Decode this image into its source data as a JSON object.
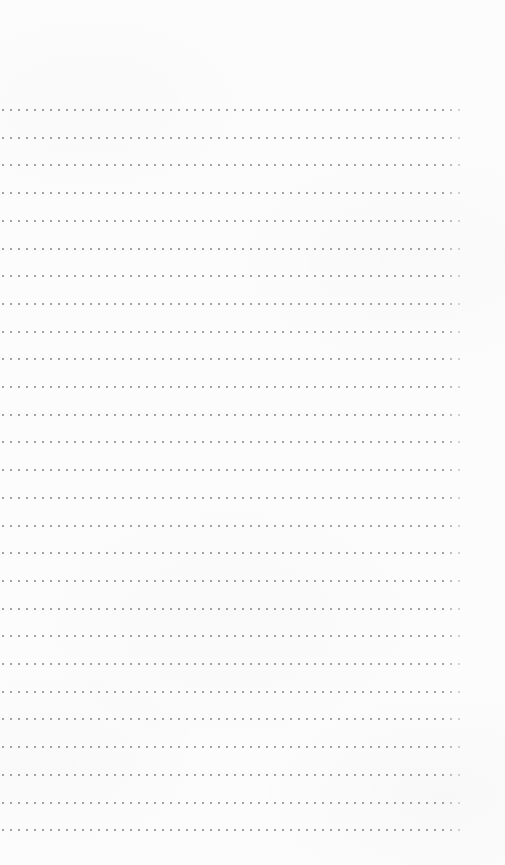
{
  "page": {
    "kind": "dotted-line-notebook-page",
    "width": 505,
    "height": 865,
    "background_color": "#fcfcfc",
    "content_text": "",
    "has_text": false,
    "has_ui_chrome": false
  },
  "grid": {
    "dot_color": "#a2a2a5",
    "dot_size_px": 2,
    "row_count": 27,
    "dots_per_row": 58,
    "first_row_y": 109,
    "row_spacing_y": 27.7,
    "first_dot_x": 2,
    "dot_spacing_x": 8.0,
    "left_margin": 2,
    "right_margin": 40,
    "top_margin": 105,
    "bottom_margin": 35
  },
  "margins": {
    "top_label": "",
    "bottom_label": ""
  }
}
